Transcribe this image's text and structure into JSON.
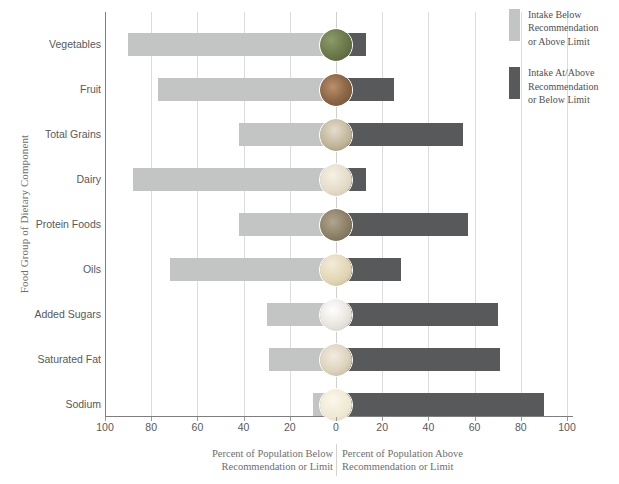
{
  "chart_data": {
    "type": "bar",
    "orientation": "horizontal-diverging",
    "title": "",
    "xlabel_left": "Percent of Population Below Recommendation or Limit",
    "xlabel_right": "Percent of Population Above Recommendation or Limit",
    "ylabel": "Food Group of Dietary Component",
    "xlim": [
      -100,
      100
    ],
    "xticks": [
      100,
      80,
      60,
      40,
      20,
      0,
      20,
      40,
      60,
      80,
      100
    ],
    "grid": true,
    "legend_position": "right",
    "categories": [
      "Vegetables",
      "Fruit",
      "Total Grains",
      "Dairy",
      "Protein Foods",
      "Oils",
      "Added Sugars",
      "Saturated Fat",
      "Sodium"
    ],
    "series": [
      {
        "name": "Intake Below Recommendation or Above Limit",
        "color": "#c3c4c4",
        "values": [
          90,
          77,
          42,
          88,
          42,
          72,
          30,
          29,
          10
        ]
      },
      {
        "name": "Intake At/Above Recommendation or Below Limit",
        "color": "#58595b",
        "values": [
          13,
          25,
          55,
          13,
          57,
          28,
          70,
          71,
          90
        ]
      }
    ]
  },
  "axes": {
    "y_title": "Food Group of Dietary Component",
    "x_tick_labels": [
      "100",
      "80",
      "60",
      "40",
      "20",
      "0",
      "20",
      "40",
      "60",
      "80",
      "100"
    ],
    "caption_left_line1": "Percent of Population Below",
    "caption_left_line2": "Recommendation or Limit",
    "caption_right_line1": "Percent of Population Above",
    "caption_right_line2": "Recommendation or Limit"
  },
  "rows": [
    {
      "label": "Vegetables",
      "below": 90,
      "above": 13,
      "icon": "vegetables-icon"
    },
    {
      "label": "Fruit",
      "below": 77,
      "above": 25,
      "icon": "fruit-icon"
    },
    {
      "label": "Total Grains",
      "below": 42,
      "above": 55,
      "icon": "grains-icon"
    },
    {
      "label": "Dairy",
      "below": 88,
      "above": 13,
      "icon": "dairy-icon"
    },
    {
      "label": "Protein Foods",
      "below": 42,
      "above": 57,
      "icon": "protein-icon"
    },
    {
      "label": "Oils",
      "below": 72,
      "above": 28,
      "icon": "oils-icon"
    },
    {
      "label": "Added Sugars",
      "below": 30,
      "above": 70,
      "icon": "added-sugars-icon"
    },
    {
      "label": "Saturated Fat",
      "below": 29,
      "above": 71,
      "icon": "saturated-fat-icon"
    },
    {
      "label": "Sodium",
      "below": 10,
      "above": 90,
      "icon": "sodium-icon"
    }
  ],
  "legend": {
    "items": [
      {
        "color": "#c3c4c4",
        "lines": [
          "Intake Below",
          "Recommendation",
          "or Above Limit"
        ]
      },
      {
        "color": "#58595b",
        "lines": [
          "Intake At/Above",
          "Recommendation",
          "or Below Limit"
        ]
      }
    ]
  },
  "colors": {
    "below": "#c3c4c4",
    "above": "#58595b",
    "axis": "#7d7e80",
    "grid": "#dcdcdc",
    "text": "#58595b",
    "caption_text": "#6d6e70"
  }
}
